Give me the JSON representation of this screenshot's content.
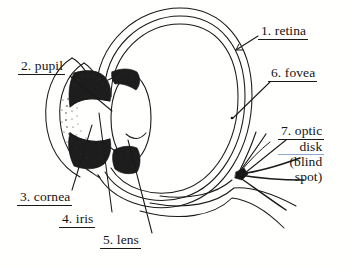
{
  "figure": {
    "background_color": "#ffffff",
    "ink_color": "#141414",
    "tint_rule_color": "#8fa8cc"
  },
  "labels": {
    "retina": {
      "text": "1. retina",
      "number": "1",
      "term": "retina"
    },
    "pupil": {
      "text": "2. pupil",
      "number": "2",
      "term": "pupil"
    },
    "cornea": {
      "text": "3. cornea",
      "number": "3",
      "term": "cornea"
    },
    "iris": {
      "text": "4. iris",
      "number": "4",
      "term": "iris"
    },
    "lens": {
      "text": "5. lens",
      "number": "5",
      "term": "lens"
    },
    "fovea": {
      "text": "6. fovea",
      "number": "6",
      "term": "fovea"
    },
    "optic_disk": {
      "line1": "7. optic",
      "line2": "disk",
      "line3": "(blind",
      "line4": "spot)",
      "number": "7",
      "term": "optic disk (blind spot)"
    }
  },
  "structures": [
    {
      "name": "sclera-outer-wall"
    },
    {
      "name": "choroid-layer"
    },
    {
      "name": "retina-layer"
    },
    {
      "name": "cornea-arc"
    },
    {
      "name": "iris-mass"
    },
    {
      "name": "pupil-opening"
    },
    {
      "name": "lens-body"
    },
    {
      "name": "ciliary-body-upper"
    },
    {
      "name": "ciliary-body-lower"
    },
    {
      "name": "optic-nerve-bundle"
    },
    {
      "name": "optic-disk-node"
    },
    {
      "name": "fovea-point"
    }
  ]
}
